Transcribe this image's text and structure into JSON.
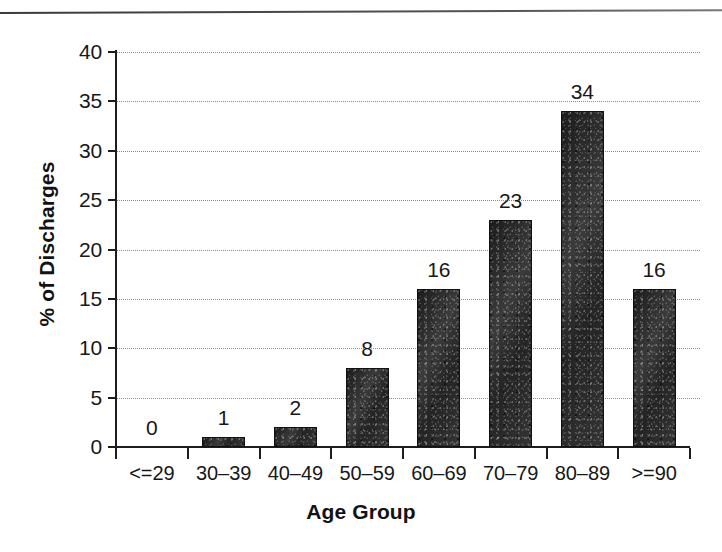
{
  "chart_data": {
    "type": "bar",
    "title": "",
    "subtitle": "",
    "xlabel": "Age Group",
    "ylabel": "% of Discharges",
    "categories": [
      "<=29",
      "30–39",
      "40–49",
      "50–59",
      "60–69",
      "70–79",
      "80–89",
      ">=90"
    ],
    "values": [
      0,
      1,
      2,
      8,
      16,
      23,
      34,
      16
    ],
    "data_labels": [
      "0",
      "1",
      "2",
      "8",
      "16",
      "23",
      "34",
      "16"
    ],
    "ylim": [
      0,
      40
    ],
    "ytick_step": 5,
    "ytick_labels": [
      "0",
      "5",
      "10",
      "15",
      "20",
      "25",
      "30",
      "35",
      "40"
    ],
    "grid": "horizontal-dotted",
    "legend": "none",
    "bar_color": "#2b2b2b",
    "grid_color": "#8c8c8c",
    "axis_color": "#1d1d1d",
    "text_color": "#171717",
    "background": "#ffffff"
  },
  "figure": {
    "top_rule_visible": true
  }
}
